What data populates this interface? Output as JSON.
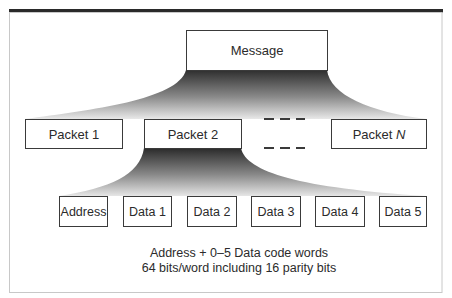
{
  "diagram": {
    "type": "hierarchy",
    "root": {
      "label": "Message"
    },
    "packets": [
      {
        "label": "Packet 1"
      },
      {
        "label": "Packet 2",
        "expanded": true
      },
      {
        "label_prefix": "Packet ",
        "label_suffix": "N"
      }
    ],
    "ellipsis": "- - -",
    "code_words": [
      {
        "label": "Address"
      },
      {
        "label": "Data 1"
      },
      {
        "label": "Data 2"
      },
      {
        "label": "Data 3"
      },
      {
        "label": "Data 4"
      },
      {
        "label": "Data 5"
      }
    ],
    "caption": {
      "line1": "Address + 0–5 Data code words",
      "line2": "64 bits/word including 16 parity bits"
    },
    "colors": {
      "frame": "#c8c8c8",
      "top_rule": "#2a2a2a",
      "box_border": "#3a3a3a",
      "fan_dark": "#2e2e2e",
      "fan_light": "#e6e6e6",
      "text": "#2b2b2b"
    }
  }
}
